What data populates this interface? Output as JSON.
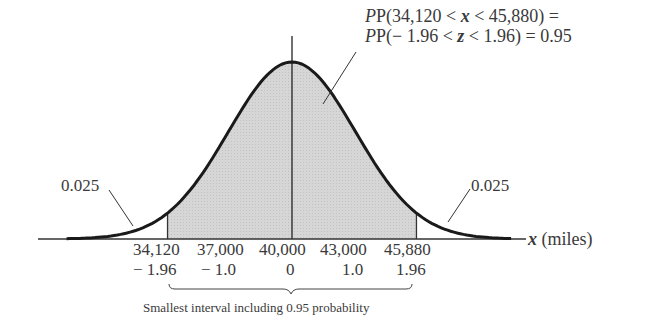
{
  "chart_data": {
    "type": "area",
    "title": "",
    "xlabel": "x (miles)",
    "ylabel": "",
    "mean": 40000,
    "sd": 3000,
    "x_ticks": [
      "34,120",
      "37,000",
      "40,000",
      "43,000",
      "45,880"
    ],
    "z_ticks": [
      "− 1.96",
      "− 1.0",
      "0",
      "1.0",
      "1.96"
    ],
    "x_values": [
      34120,
      37000,
      40000,
      43000,
      45880
    ],
    "z_values": [
      -1.96,
      -1.0,
      0,
      1.0,
      1.96
    ],
    "shaded_region": {
      "from": 34120,
      "to": 45880,
      "probability": 0.95
    },
    "tails": [
      {
        "side": "left",
        "probability": 0.025
      },
      {
        "side": "right",
        "probability": 0.025
      }
    ],
    "annotations": [
      "P(34,120 < x < 45,880) =",
      "P(− 1.96 < z < 1.96) = 0.95",
      "0.025",
      "0.025",
      "Smallest interval including 0.95 probability"
    ],
    "grid": false
  },
  "labels": {
    "prob_line1_prefix": "P(34,120 < ",
    "prob_line1_var": "x",
    "prob_line1_suffix": " < 45,880) =",
    "prob_line2_prefix": "P(− 1.96 < ",
    "prob_line2_var": "z",
    "prob_line2_suffix": " < 1.96) = 0.95",
    "left_tail": "0.025",
    "right_tail": "0.025",
    "axis_var": "x",
    "axis_unit": " (miles)",
    "x_ticks": [
      "34,120",
      "37,000",
      "40,000",
      "43,000",
      "45,880"
    ],
    "z_ticks": [
      "− 1.96",
      "− 1.0",
      "0",
      "1.0",
      "1.96"
    ],
    "interval_caption": "Smallest interval including 0.95 probability"
  },
  "colors": {
    "shade": "#d4d4d4",
    "curve": "#1a1a1a",
    "axis": "#333333"
  }
}
